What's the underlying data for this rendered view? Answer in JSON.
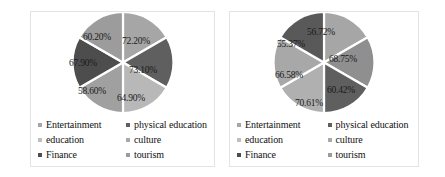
{
  "legend": {
    "items": [
      {
        "label": "Entertainment",
        "color": "#a6a6a6"
      },
      {
        "label": "physical education",
        "color": "#5f5f5f"
      },
      {
        "label": "education",
        "color": "#bfbfbf"
      },
      {
        "label": "culture",
        "color": "#a9a9a9"
      },
      {
        "label": "Finance",
        "color": "#4d4d4d"
      },
      {
        "label": "tourism",
        "color": "#9c9c9c"
      }
    ]
  },
  "chart_data": [
    {
      "type": "pie",
      "title": "",
      "legend_position": "bottom",
      "categories": [
        "Entertainment",
        "physical education",
        "culture",
        "education",
        "Finance",
        "tourism"
      ],
      "labels": [
        "72.20%",
        "73.10%",
        "64.90%",
        "58.60%",
        "67.90%",
        "60.20%"
      ],
      "values": [
        72.2,
        73.1,
        64.9,
        58.6,
        67.9,
        60.2
      ],
      "slice_colors": [
        "#a6a6a6",
        "#5f5f5f",
        "#b8b8b8",
        "#a0a0a0",
        "#4d4d4d",
        "#9c9c9c"
      ],
      "slice_fractions": [
        16.667,
        16.667,
        16.667,
        16.667,
        16.667,
        16.667
      ],
      "label_positions": [
        {
          "x": 69,
          "y": 29
        },
        {
          "x": 76,
          "y": 58
        },
        {
          "x": 64,
          "y": 86
        },
        {
          "x": 25,
          "y": 79
        },
        {
          "x": 16,
          "y": 51
        },
        {
          "x": 30,
          "y": 25
        }
      ]
    },
    {
      "type": "pie",
      "title": "",
      "legend_position": "bottom",
      "categories": [
        "Entertainment",
        "physical education",
        "culture",
        "education",
        "Finance",
        "tourism"
      ],
      "labels": [
        "56.72%",
        "68.75%",
        "60.42%",
        "70.61%",
        "66.58%",
        "55.37%"
      ],
      "values": [
        56.72,
        68.75,
        60.42,
        70.61,
        66.58,
        55.37
      ],
      "slice_colors": [
        "#a6a6a6",
        "#8f8f8f",
        "#5f5f5f",
        "#b0b0b0",
        "#a8a8a8",
        "#595959"
      ],
      "slice_fractions": [
        16.667,
        16.667,
        16.667,
        16.667,
        16.667,
        16.667
      ],
      "label_positions": [
        {
          "x": 52,
          "y": 20
        },
        {
          "x": 74,
          "y": 47
        },
        {
          "x": 72,
          "y": 78
        },
        {
          "x": 40,
          "y": 91
        },
        {
          "x": 20,
          "y": 63
        },
        {
          "x": 22,
          "y": 32
        }
      ]
    }
  ]
}
